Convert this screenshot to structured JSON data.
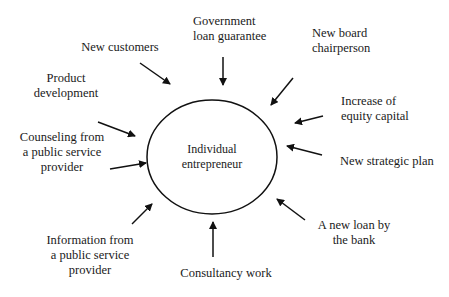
{
  "diagram": {
    "center": {
      "line1": "Individual",
      "line2": "entrepreneur"
    },
    "nodes": [
      {
        "id": "new-customers",
        "lines": [
          "New customers"
        ]
      },
      {
        "id": "government-loan-guarantee",
        "lines": [
          "Government",
          "loan guarantee"
        ]
      },
      {
        "id": "new-board-chairperson",
        "lines": [
          "New board",
          "chairperson"
        ]
      },
      {
        "id": "product-development",
        "lines": [
          "Product",
          "development"
        ]
      },
      {
        "id": "increase-of-equity-capital",
        "lines": [
          "Increase of",
          "equity capital"
        ]
      },
      {
        "id": "counseling-public-service",
        "lines": [
          "Counseling from",
          "a public service",
          "provider"
        ]
      },
      {
        "id": "new-strategic-plan",
        "lines": [
          "New strategic plan"
        ]
      },
      {
        "id": "information-public-service",
        "lines": [
          "Information from",
          "a public service",
          "provider"
        ]
      },
      {
        "id": "new-loan-by-bank",
        "lines": [
          "A new loan by",
          "the bank"
        ]
      },
      {
        "id": "consultancy-work",
        "lines": [
          "Consultancy work"
        ]
      }
    ],
    "colors": {
      "stroke": "#111111",
      "text": "#1a1a1a",
      "background": "#ffffff"
    }
  }
}
